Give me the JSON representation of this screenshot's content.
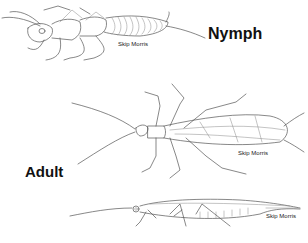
{
  "figure": {
    "labels": {
      "nymph": "Nymph",
      "adult": "Adult"
    },
    "credits": {
      "nymph": "Skip Morris",
      "adult_top": "Skip Morris",
      "adult_side": "Skip Morris"
    },
    "illustrations": [
      {
        "name": "nymph-dorsal-view",
        "description": "Stonefly nymph line drawing, dorsal view"
      },
      {
        "name": "adult-dorsal-view",
        "description": "Stonefly adult line drawing, dorsal view with wings folded"
      },
      {
        "name": "adult-side-view",
        "description": "Stonefly adult line drawing, side view"
      }
    ],
    "colors": {
      "background": "#ffffff",
      "line": "#555555",
      "text": "#111111"
    }
  }
}
